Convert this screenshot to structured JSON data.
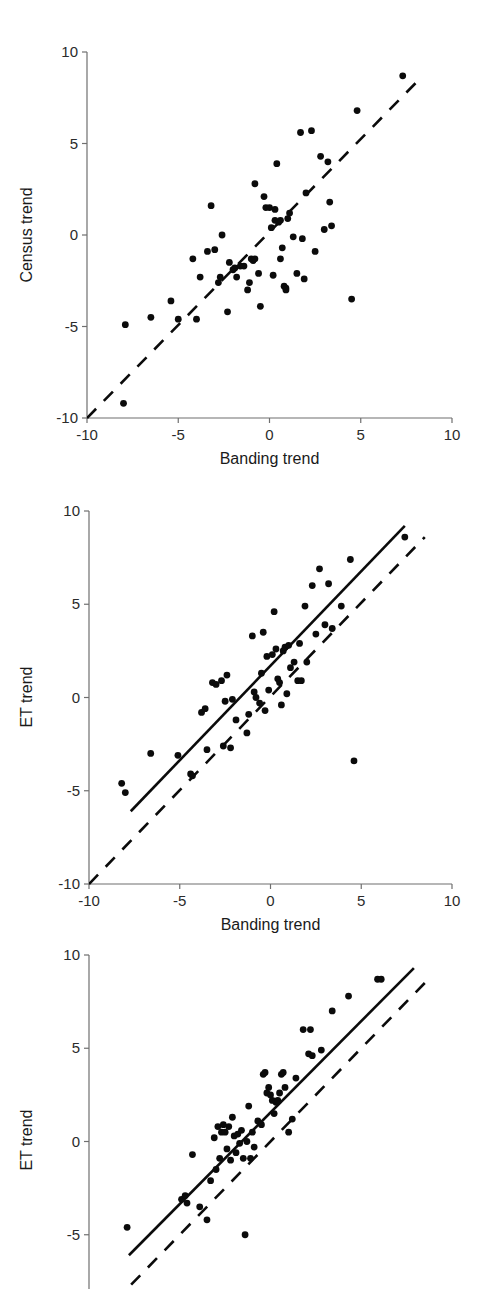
{
  "figure": {
    "kind": "scatter-panel-figure",
    "panel_count": 3,
    "point_color": "#0b0b0b",
    "line_color": "#0b0b0b",
    "axis_color": "#6f6f6f"
  },
  "chart_data": [
    {
      "id": "panel-census-vs-banding",
      "type": "scatter",
      "title": "",
      "xlabel": "Banding trend",
      "ylabel": "Census trend",
      "xlim": [
        -10,
        10
      ],
      "ylim": [
        -10,
        10
      ],
      "xticks": [
        -10,
        -5,
        0,
        5,
        10
      ],
      "yticks": [
        -10,
        -5,
        0,
        5,
        10
      ],
      "xticklabels": [
        "-10",
        "-5",
        "0",
        "5",
        "10"
      ],
      "yticklabels": [
        "-10",
        "-5",
        "0",
        "5",
        "10"
      ],
      "grid": false,
      "legend": "none",
      "annotations": [],
      "reference_line": {
        "style": "dashed",
        "label": "1:1 line",
        "x": [
          -10,
          8.4
        ],
        "y": [
          -10,
          8.7
        ]
      },
      "fit_line": null,
      "points": [
        [
          -8.0,
          -9.2
        ],
        [
          -7.9,
          -4.9
        ],
        [
          -6.5,
          -4.5
        ],
        [
          -5.4,
          -3.6
        ],
        [
          -5.0,
          -4.6
        ],
        [
          -4.2,
          -1.3
        ],
        [
          -4.0,
          -4.6
        ],
        [
          -3.8,
          -2.3
        ],
        [
          -3.4,
          -0.9
        ],
        [
          -3.2,
          1.6
        ],
        [
          -3.0,
          -0.8
        ],
        [
          -2.8,
          -2.6
        ],
        [
          -2.7,
          -2.3
        ],
        [
          -2.6,
          0.0
        ],
        [
          -2.3,
          -4.2
        ],
        [
          -2.2,
          -1.5
        ],
        [
          -2.0,
          -1.9
        ],
        [
          -1.9,
          -1.8
        ],
        [
          -1.8,
          -2.3
        ],
        [
          -1.6,
          -1.7
        ],
        [
          -1.4,
          -1.7
        ],
        [
          -1.2,
          -3.0
        ],
        [
          -1.1,
          -2.6
        ],
        [
          -1.0,
          -1.3
        ],
        [
          -0.9,
          -1.4
        ],
        [
          -0.8,
          -1.3
        ],
        [
          -0.8,
          2.8
        ],
        [
          -0.6,
          -2.1
        ],
        [
          -0.5,
          -3.9
        ],
        [
          -0.3,
          2.1
        ],
        [
          -0.2,
          1.5
        ],
        [
          0.0,
          1.5
        ],
        [
          0.1,
          0.4
        ],
        [
          0.2,
          -2.2
        ],
        [
          0.3,
          1.4
        ],
        [
          0.3,
          0.8
        ],
        [
          0.4,
          3.9
        ],
        [
          0.5,
          0.7
        ],
        [
          0.6,
          0.8
        ],
        [
          0.6,
          -1.3
        ],
        [
          0.7,
          -0.7
        ],
        [
          0.8,
          -2.8
        ],
        [
          0.9,
          -2.9
        ],
        [
          0.9,
          -3.0
        ],
        [
          1.0,
          0.9
        ],
        [
          1.1,
          1.2
        ],
        [
          1.3,
          -0.1
        ],
        [
          1.5,
          -2.1
        ],
        [
          1.7,
          5.6
        ],
        [
          1.8,
          -0.2
        ],
        [
          1.9,
          -2.4
        ],
        [
          2.0,
          2.3
        ],
        [
          2.3,
          5.7
        ],
        [
          2.5,
          -0.9
        ],
        [
          2.8,
          4.3
        ],
        [
          3.0,
          0.3
        ],
        [
          3.2,
          4.0
        ],
        [
          3.3,
          1.8
        ],
        [
          3.4,
          0.5
        ],
        [
          4.5,
          -3.5
        ],
        [
          4.8,
          6.8
        ],
        [
          7.3,
          8.7
        ]
      ]
    },
    {
      "id": "panel-et-vs-banding",
      "type": "scatter",
      "title": "",
      "xlabel": "Banding trend",
      "ylabel": "ET trend",
      "xlim": [
        -10,
        10
      ],
      "ylim": [
        -10,
        10
      ],
      "xticks": [
        -10,
        -5,
        0,
        5,
        10
      ],
      "yticks": [
        -10,
        -5,
        0,
        5,
        10
      ],
      "xticklabels": [
        "-10",
        "-5",
        "0",
        "5",
        "10"
      ],
      "yticklabels": [
        "-10",
        "-5",
        "0",
        "5",
        "10"
      ],
      "grid": false,
      "legend": "none",
      "annotations": [],
      "reference_line": {
        "style": "dashed",
        "label": "1:1 line",
        "x": [
          -10,
          8.5
        ],
        "y": [
          -10,
          8.6
        ]
      },
      "fit_line": {
        "style": "solid",
        "label": "regression",
        "x": [
          -7.7,
          7.4
        ],
        "y": [
          -6.1,
          9.2
        ]
      },
      "points": [
        [
          -8.2,
          -4.6
        ],
        [
          -8.0,
          -5.1
        ],
        [
          -6.6,
          -3.0
        ],
        [
          -5.1,
          -3.1
        ],
        [
          -4.4,
          -4.1
        ],
        [
          -4.3,
          -4.2
        ],
        [
          -3.8,
          -0.8
        ],
        [
          -3.6,
          -0.6
        ],
        [
          -3.5,
          -2.8
        ],
        [
          -3.2,
          0.8
        ],
        [
          -3.0,
          0.7
        ],
        [
          -2.7,
          0.9
        ],
        [
          -2.6,
          -2.6
        ],
        [
          -2.5,
          -0.2
        ],
        [
          -2.4,
          1.2
        ],
        [
          -2.2,
          -2.7
        ],
        [
          -2.1,
          -0.1
        ],
        [
          -1.9,
          -1.2
        ],
        [
          -1.3,
          -1.9
        ],
        [
          -1.2,
          -0.9
        ],
        [
          -1.0,
          3.3
        ],
        [
          -0.9,
          0.3
        ],
        [
          -0.8,
          0.0
        ],
        [
          -0.6,
          -0.3
        ],
        [
          -0.5,
          1.3
        ],
        [
          -0.4,
          3.5
        ],
        [
          -0.3,
          -0.7
        ],
        [
          -0.2,
          2.2
        ],
        [
          -0.1,
          0.4
        ],
        [
          0.1,
          2.3
        ],
        [
          0.2,
          4.6
        ],
        [
          0.3,
          2.6
        ],
        [
          0.4,
          1.0
        ],
        [
          0.5,
          0.8
        ],
        [
          0.6,
          -0.4
        ],
        [
          0.7,
          2.5
        ],
        [
          0.8,
          2.7
        ],
        [
          0.9,
          0.2
        ],
        [
          1.0,
          2.8
        ],
        [
          1.1,
          1.6
        ],
        [
          1.3,
          1.9
        ],
        [
          1.5,
          0.9
        ],
        [
          1.6,
          2.9
        ],
        [
          1.7,
          0.9
        ],
        [
          1.9,
          4.9
        ],
        [
          2.0,
          1.9
        ],
        [
          2.3,
          6.0
        ],
        [
          2.5,
          3.4
        ],
        [
          2.7,
          6.9
        ],
        [
          3.0,
          3.9
        ],
        [
          3.2,
          6.1
        ],
        [
          3.4,
          3.7
        ],
        [
          3.9,
          4.9
        ],
        [
          4.4,
          7.4
        ],
        [
          4.6,
          -3.4
        ],
        [
          7.4,
          8.6
        ]
      ]
    },
    {
      "id": "panel-et-vs-census",
      "type": "scatter",
      "title": "",
      "xlabel": "",
      "ylabel": "ET trend",
      "xlim": [
        -10,
        10
      ],
      "ylim": [
        -10,
        10
      ],
      "xticks": [],
      "yticks": [
        -5,
        0,
        5,
        10
      ],
      "xticklabels": [],
      "yticklabels": [
        "-5",
        "0",
        "5",
        "10"
      ],
      "grid": false,
      "legend": "none",
      "annotations": [],
      "note": "bottom of panel cropped by image edge",
      "reference_line": {
        "style": "dashed",
        "label": "1:1 line",
        "x": [
          -8.6,
          8.6
        ],
        "y": [
          -8.6,
          8.6
        ]
      },
      "fit_line": {
        "style": "solid",
        "label": "regression",
        "x": [
          -7.8,
          7.9
        ],
        "y": [
          -6.1,
          9.3
        ]
      },
      "points": [
        [
          -7.9,
          -4.6
        ],
        [
          -4.9,
          -3.1
        ],
        [
          -4.7,
          -2.9
        ],
        [
          -4.6,
          -3.3
        ],
        [
          -4.3,
          -0.7
        ],
        [
          -3.9,
          -3.5
        ],
        [
          -3.5,
          -4.2
        ],
        [
          -3.3,
          -2.1
        ],
        [
          -3.1,
          0.2
        ],
        [
          -3.0,
          -1.5
        ],
        [
          -2.9,
          0.8
        ],
        [
          -2.8,
          -0.9
        ],
        [
          -2.7,
          0.5
        ],
        [
          -2.6,
          0.9
        ],
        [
          -2.5,
          0.5
        ],
        [
          -2.4,
          -0.4
        ],
        [
          -2.3,
          0.8
        ],
        [
          -2.2,
          -1.0
        ],
        [
          -2.1,
          1.3
        ],
        [
          -2.0,
          0.3
        ],
        [
          -1.9,
          -0.6
        ],
        [
          -1.8,
          0.4
        ],
        [
          -1.7,
          -0.1
        ],
        [
          -1.6,
          0.6
        ],
        [
          -1.5,
          -0.9
        ],
        [
          -1.4,
          -5.0
        ],
        [
          -1.3,
          0.0
        ],
        [
          -1.2,
          1.9
        ],
        [
          -1.1,
          -0.9
        ],
        [
          -1.0,
          0.5
        ],
        [
          -0.9,
          -0.3
        ],
        [
          -0.7,
          1.1
        ],
        [
          -0.5,
          0.9
        ],
        [
          -0.4,
          3.6
        ],
        [
          -0.3,
          3.7
        ],
        [
          -0.2,
          2.6
        ],
        [
          -0.1,
          2.9
        ],
        [
          0.0,
          2.5
        ],
        [
          0.1,
          2.2
        ],
        [
          0.2,
          1.5
        ],
        [
          0.3,
          2.1
        ],
        [
          0.4,
          2.2
        ],
        [
          0.5,
          2.6
        ],
        [
          0.6,
          3.6
        ],
        [
          0.7,
          3.7
        ],
        [
          0.8,
          2.9
        ],
        [
          1.0,
          0.5
        ],
        [
          1.2,
          1.2
        ],
        [
          1.4,
          3.4
        ],
        [
          1.8,
          6.0
        ],
        [
          2.1,
          4.7
        ],
        [
          2.2,
          6.0
        ],
        [
          2.3,
          4.6
        ],
        [
          2.8,
          4.9
        ],
        [
          3.4,
          7.0
        ],
        [
          4.3,
          7.8
        ],
        [
          5.9,
          8.7
        ],
        [
          6.1,
          8.7
        ]
      ]
    }
  ]
}
